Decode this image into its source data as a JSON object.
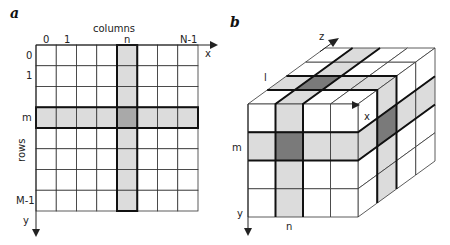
{
  "figure": {
    "panel_a": {
      "letter": "a",
      "title": "columns",
      "column_labels": [
        "0",
        "1",
        "n",
        "N-1"
      ],
      "row_labels": [
        "0",
        "1",
        "m",
        "M-1"
      ],
      "rows_axis_label": "rows",
      "x_axis": "x",
      "y_axis": "y",
      "grid": {
        "columns": 8,
        "rows": 8,
        "highlight_column_index": 4,
        "highlight_row_index": 3
      }
    },
    "panel_b": {
      "letter": "b",
      "axes": {
        "x": "x",
        "y": "y",
        "z": "z"
      },
      "labels": {
        "l": "l",
        "m": "m",
        "n": "n"
      },
      "cube": {
        "columns": 4,
        "rows": 4,
        "depth": 4,
        "highlight_column_index": 1,
        "highlight_row_index": 1,
        "highlight_depth_index": 1
      }
    },
    "colors": {
      "cell": "#ffffff",
      "highlight": "#dcdcdc",
      "intersection": "#7a7a7a",
      "line": "#333333"
    }
  }
}
